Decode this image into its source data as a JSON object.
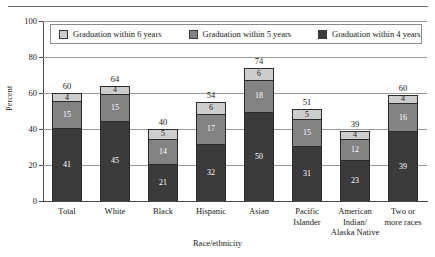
{
  "chart_data": {
    "type": "bar",
    "subtype": "stacked-vertical",
    "title": "",
    "xlabel": "Race/ethnicity",
    "ylabel": "Percent",
    "ylim": [
      0,
      100
    ],
    "yticks": [
      0,
      20,
      40,
      60,
      80,
      100
    ],
    "grid": true,
    "legend_position": "top-inside",
    "categories": [
      "Total",
      "White",
      "Black",
      "Hispanic",
      "Asian",
      "Pacific Islander",
      "American Indian/ Alaska Native",
      "Two or more races"
    ],
    "category_lines": [
      [
        "Total"
      ],
      [
        "White"
      ],
      [
        "Black"
      ],
      [
        "Hispanic"
      ],
      [
        "Asian"
      ],
      [
        "Pacific",
        "Islander"
      ],
      [
        "American",
        "Indian/",
        "Alaska Native"
      ],
      [
        "Two or",
        "more races"
      ]
    ],
    "series": [
      {
        "name": "Graduation within 4 years",
        "color": "#3b3b3b",
        "values": [
          41,
          45,
          21,
          32,
          50,
          31,
          23,
          39
        ]
      },
      {
        "name": "Graduation within 5 years",
        "color": "#838383",
        "values": [
          15,
          15,
          14,
          17,
          18,
          15,
          12,
          16
        ]
      },
      {
        "name": "Graduation within 6 years",
        "color": "#cdcdcd",
        "values": [
          4,
          4,
          5,
          6,
          6,
          5,
          4,
          4
        ]
      }
    ],
    "totals": [
      60,
      64,
      40,
      54,
      74,
      51,
      39,
      60
    ]
  },
  "legend": {
    "items": [
      {
        "label": "Graduation within 6 years",
        "swatch": "s6"
      },
      {
        "label": "Graduation within 5 years",
        "swatch": "s5"
      },
      {
        "label": "Graduation within 4 years",
        "swatch": "s4"
      }
    ]
  },
  "colors": {
    "within_6_years": "#cdcdcd",
    "within_5_years": "#838383",
    "within_4_years": "#3b3b3b",
    "axis": "#4a4a4a",
    "gridline": "#9a9a9a",
    "text": "#1a1a1a",
    "background": "#ffffff"
  }
}
